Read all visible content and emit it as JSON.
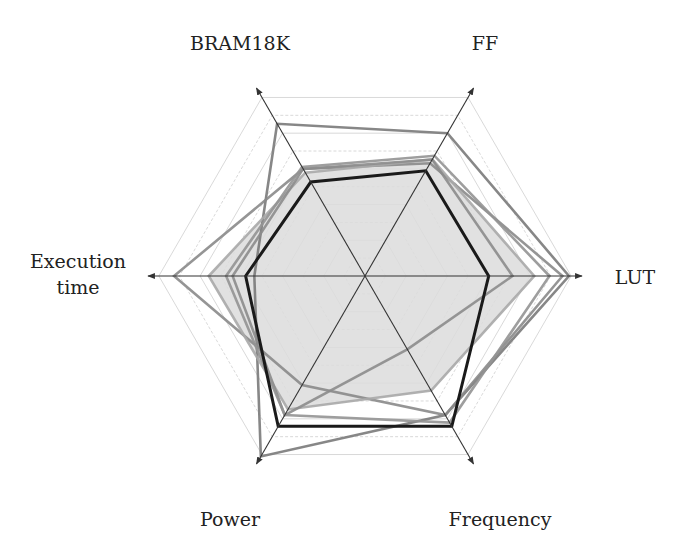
{
  "chart_data": {
    "type": "radar",
    "title": "",
    "axes": [
      "LUT",
      "FF",
      "BRAM18K",
      "Execution time",
      "Power",
      "Frequency"
    ],
    "axis_angles_deg": [
      0,
      60,
      120,
      180,
      240,
      300
    ],
    "range": [
      0,
      1
    ],
    "grid_levels": 10,
    "grid": true,
    "legend": null,
    "series": [
      {
        "name": "series-1",
        "style": "thick-black",
        "color": "#1a1a1a",
        "fill": false,
        "values": [
          0.57,
          0.56,
          0.5,
          0.55,
          0.8,
          0.8
        ]
      },
      {
        "name": "series-2",
        "style": "grey",
        "color": "#7a7a7a",
        "fill": false,
        "values": [
          0.94,
          0.76,
          0.81,
          0.51,
          0.96,
          0.74
        ]
      },
      {
        "name": "series-3",
        "style": "grey",
        "color": "#8a8a8a",
        "fill": false,
        "values": [
          0.91,
          0.6,
          0.57,
          0.88,
          0.58,
          0.74
        ]
      },
      {
        "name": "series-4",
        "style": "grey-filled",
        "color": "#a8a8a8",
        "fill": true,
        "fill_color": "#dcdcdc",
        "values": [
          0.78,
          0.62,
          0.55,
          0.72,
          0.71,
          0.61
        ]
      },
      {
        "name": "series-5",
        "style": "grey",
        "color": "#8c8c8c",
        "fill": false,
        "values": [
          0.68,
          0.62,
          0.57,
          0.61,
          0.74,
          0.39
        ]
      },
      {
        "name": "series-6",
        "style": "grey",
        "color": "#939393",
        "fill": false,
        "values": [
          0.85,
          0.64,
          0.58,
          0.64,
          0.74,
          0.78
        ]
      }
    ]
  },
  "labels": {
    "lut": "LUT",
    "ff": "FF",
    "bram": "BRAM18K",
    "exec": "Execution\ntime",
    "power": "Power",
    "frequency": "Frequency"
  }
}
